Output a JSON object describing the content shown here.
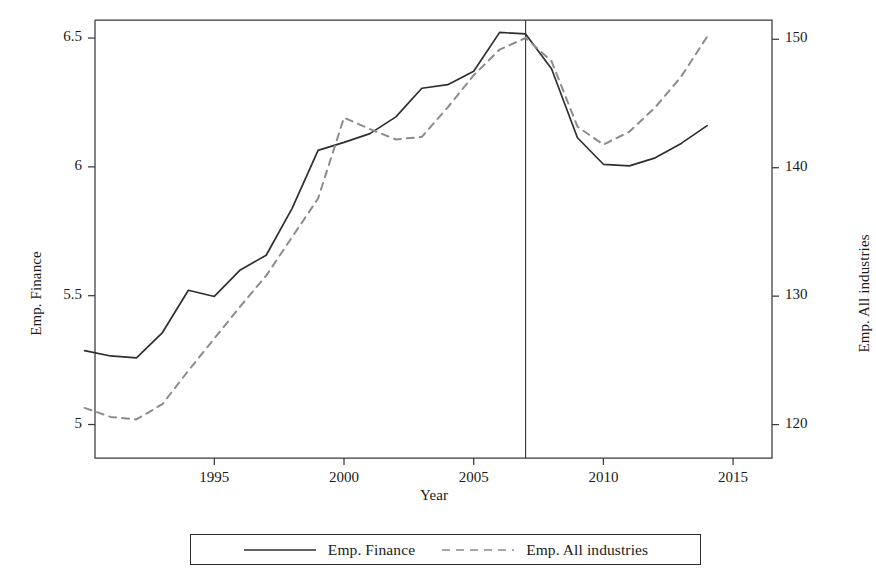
{
  "chart_data": {
    "type": "line",
    "title": "",
    "xlabel": "Year",
    "ylabel_left": "Emp. Finance",
    "ylabel_right": "Emp. All industries",
    "xlim": [
      1990.4,
      2016.5
    ],
    "xticks": [
      1995,
      2000,
      2005,
      2010,
      2015
    ],
    "xticklabels": [
      "1995",
      "2000",
      "2005",
      "2010",
      "2015"
    ],
    "ylim_left": [
      4.87,
      6.57
    ],
    "yticks_left": [
      5,
      5.5,
      6,
      6.5
    ],
    "yticklabels_left": [
      "5",
      "5.5",
      "6",
      "6.5"
    ],
    "ylim_right": [
      117.4,
      151.5
    ],
    "yticks_right": [
      120,
      130,
      140,
      150
    ],
    "yticklabels_right": [
      "120",
      "130",
      "140",
      "150"
    ],
    "grid": false,
    "legend_position": "bottom-center",
    "annotations": [
      {
        "type": "vline",
        "x": 2007,
        "style": "solid",
        "color": "#3a3a40"
      }
    ],
    "series": [
      {
        "name": "Emp. Finance",
        "axis": "left",
        "style": "solid",
        "color": "#2e2e33",
        "x": [
          1990,
          1991,
          1992,
          1993,
          1994,
          1995,
          1996,
          1997,
          1998,
          1999,
          2000,
          2001,
          2002,
          2003,
          2004,
          2005,
          2006,
          2007,
          2008,
          2009,
          2010,
          2011,
          2012,
          2013,
          2014
        ],
        "values": [
          5.287,
          5.266,
          5.259,
          5.357,
          5.521,
          5.497,
          5.6,
          5.657,
          5.839,
          6.064,
          6.095,
          6.129,
          6.194,
          6.305,
          6.319,
          6.371,
          6.522,
          6.516,
          6.381,
          6.113,
          6.01,
          6.004,
          6.035,
          6.091,
          6.16
        ]
      },
      {
        "name": "Emp. All industries",
        "axis": "right",
        "style": "dashed",
        "color": "#8b8b90",
        "x": [
          1990,
          1991,
          1992,
          1993,
          1994,
          1995,
          1996,
          1997,
          1998,
          1999,
          2000,
          2001,
          2002,
          2003,
          2004,
          2005,
          2006,
          2007,
          2008,
          2009,
          2010,
          2011,
          2012,
          2013,
          2014
        ],
        "values": [
          121.3,
          120.6,
          120.4,
          121.6,
          124.2,
          126.7,
          129.2,
          131.6,
          134.6,
          137.6,
          143.9,
          143.0,
          142.2,
          142.4,
          144.7,
          147.2,
          149.2,
          150.1,
          148.3,
          143.2,
          141.8,
          142.8,
          144.7,
          147.1,
          150.2
        ]
      }
    ]
  },
  "legend": {
    "items": [
      {
        "label": "Emp. Finance",
        "style": "solid"
      },
      {
        "label": "Emp. All industries",
        "style": "dashed"
      }
    ]
  },
  "frame": {
    "left": 95,
    "right": 772,
    "top": 20,
    "bottom": 458
  }
}
